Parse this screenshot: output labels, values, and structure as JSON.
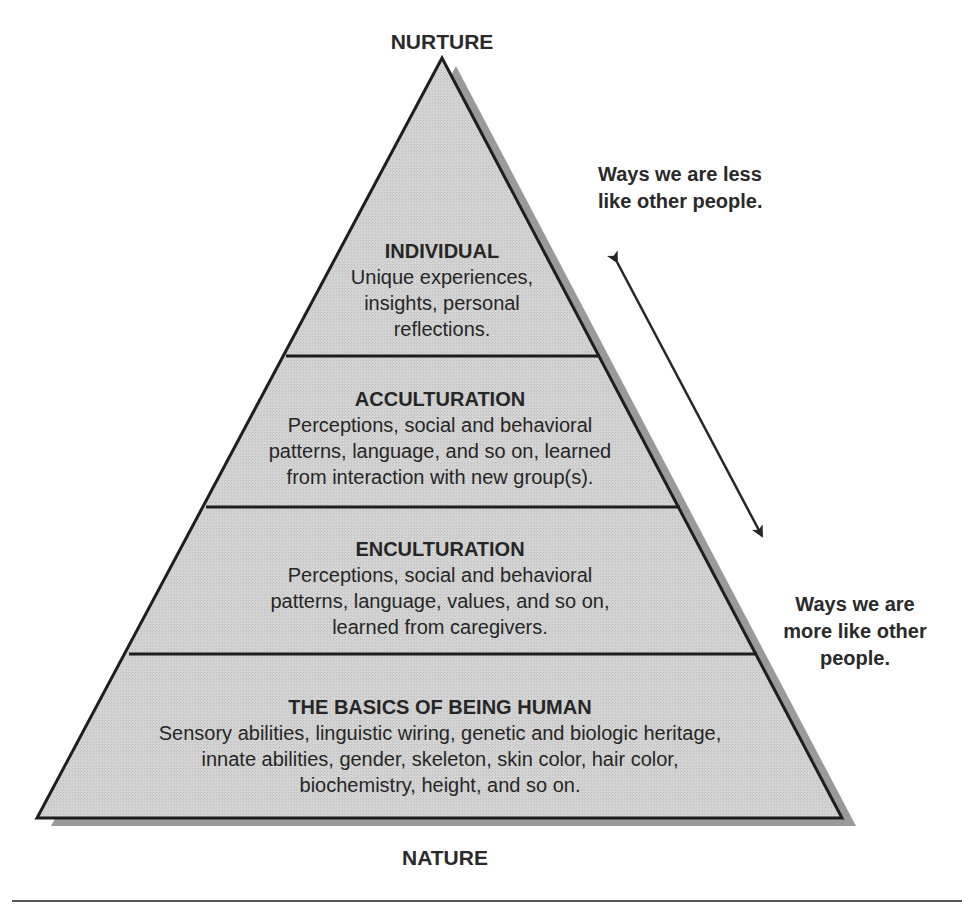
{
  "diagram": {
    "title_top": "NURTURE",
    "title_bottom": "NATURE",
    "colors": {
      "fill": "#d2d2d2",
      "shadow": "#9a9a9a",
      "stroke": "#1e1e1e",
      "text": "#262626"
    },
    "levels": [
      {
        "heading": "INDIVIDUAL",
        "lines": [
          "Unique experiences,",
          "insights, personal",
          "reflections."
        ]
      },
      {
        "heading": "ACCULTURATION",
        "lines": [
          "Perceptions, social and behavioral",
          "patterns, language, and so on, learned",
          "from interaction with new group(s)."
        ]
      },
      {
        "heading": "ENCULTURATION",
        "lines": [
          "Perceptions, social and behavioral",
          "patterns, language, values, and so on,",
          "learned from caregivers."
        ]
      },
      {
        "heading": "THE BASICS OF BEING HUMAN",
        "lines": [
          "Sensory abilities, linguistic wiring, genetic and biologic heritage,",
          "innate abilities, gender, skeleton, skin color, hair color,",
          "biochemistry, height, and so on."
        ]
      }
    ],
    "side_notes": {
      "top": [
        "Ways we are less",
        "like other people."
      ],
      "bottom": [
        "Ways we are",
        "more like other",
        "people."
      ]
    },
    "arrow": {
      "direction": "bidirectional"
    }
  }
}
